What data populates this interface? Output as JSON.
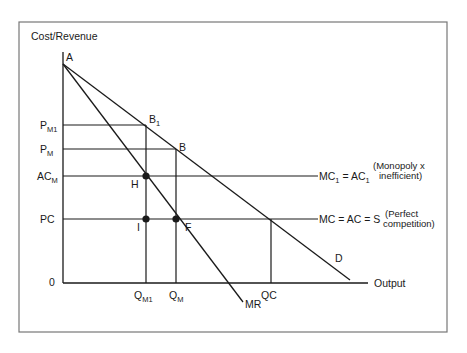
{
  "diagram": {
    "y_axis_label": "Cost/Revenue",
    "x_axis_label": "Output",
    "origin_label": "0",
    "points": {
      "A": "A",
      "B1": {
        "main": "B",
        "sub": "1"
      },
      "B": "B",
      "H": "H",
      "I": "I",
      "F": "F"
    },
    "y_ticks": {
      "pm1": {
        "main": "P",
        "sub": "M1"
      },
      "pm": {
        "main": "P",
        "sub": "M"
      },
      "acm": {
        "main": "AC",
        "sub": "M"
      },
      "pc": "PC"
    },
    "x_ticks": {
      "qm1": {
        "main": "Q",
        "sub": "M1"
      },
      "qm": {
        "main": "Q",
        "sub": "M"
      },
      "qc": "QC"
    },
    "curves": {
      "demand": "D",
      "marginal_revenue": "MR",
      "mc1_line": {
        "mc": "MC",
        "mc_sub": "1",
        "eq": " = AC",
        "ac_sub": "1",
        "note_line1": "(Monopoly x",
        "note_line2": "inefficient)"
      },
      "mc_line": {
        "text": "MC = AC = S",
        "note_line1": "(Perfect",
        "note_line2": "competition)"
      }
    }
  }
}
